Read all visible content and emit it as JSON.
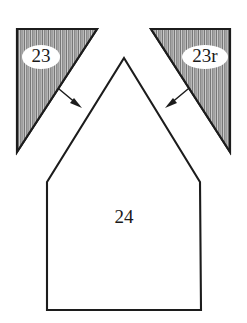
{
  "figure": {
    "type": "technical-line-drawing",
    "background_color": "#ffffff",
    "line_color": "#1c1c1c",
    "hatch_color": "#8e8e8e",
    "canvas": {
      "width": 247,
      "height": 323
    },
    "labels": {
      "left_triangle": "23",
      "right_triangle": "23r",
      "center_body": "24"
    },
    "label_positions": {
      "left_triangle": {
        "x": 41,
        "y": 57
      },
      "right_triangle": {
        "x": 205,
        "y": 57
      },
      "center_body": {
        "x": 124,
        "y": 219
      }
    },
    "shapes": {
      "left_hatched_triangle": {
        "name": "left-hatched-triangle",
        "fill": "vertical-hatch",
        "points": "17,29 97,29 17,152"
      },
      "right_hatched_triangle": {
        "name": "right-hatched-triangle",
        "fill": "vertical-hatch",
        "points": "151,29 230,29 230,152"
      },
      "center_pentagon": {
        "name": "center-pentagon-body",
        "fill": "none",
        "points": "124,58 200,182 201,310 47,310 47,182"
      }
    },
    "arrows": [
      {
        "name": "left-leader-arrow",
        "from": {
          "x": 59,
          "y": 89
        },
        "to": {
          "x": 81,
          "y": 107
        },
        "direction": "down-right"
      },
      {
        "name": "right-leader-arrow",
        "from": {
          "x": 188,
          "y": 89
        },
        "to": {
          "x": 166,
          "y": 107
        },
        "direction": "down-left"
      }
    ]
  }
}
